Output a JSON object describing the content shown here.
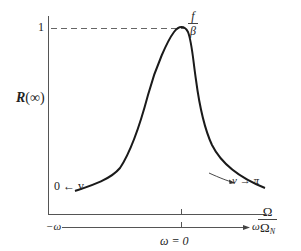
{
  "figure": {
    "type": "diagram",
    "y_axis": {
      "label_main": "R",
      "label_arg": "(∞)",
      "top_tick_label": "1"
    },
    "x_axis": {
      "ratio_numerator": "Ω",
      "ratio_denominator": "Ω",
      "ratio_denominator_sub": "N",
      "lower_axis_left": "−ω",
      "lower_axis_right": "ω",
      "center_label": "ω = 0"
    },
    "peak_label": {
      "numerator": "f",
      "denominator": "β"
    },
    "annotations": {
      "left_asymptote": "0 ← v",
      "right_asymptote": "v → π"
    },
    "colors": {
      "curve": "#1a1a1a",
      "axis": "#555555",
      "dashed": "#555555",
      "background": "#ffffff"
    }
  }
}
